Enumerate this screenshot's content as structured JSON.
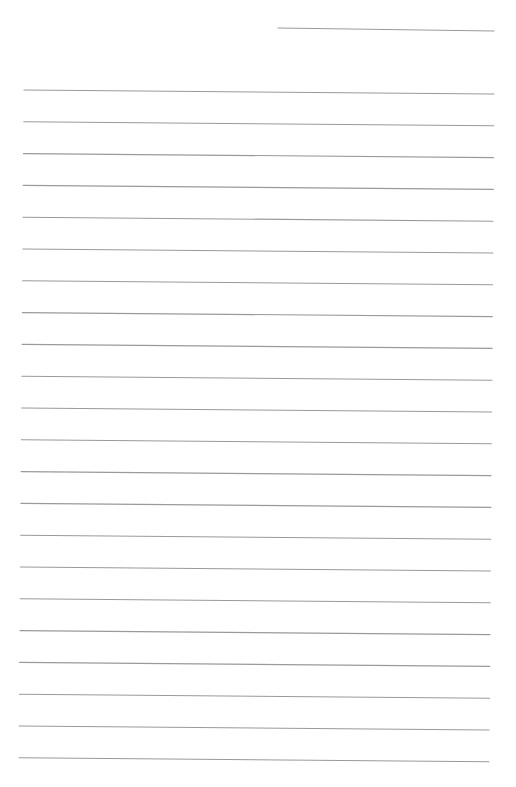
{
  "page": {
    "type": "lined-paper",
    "background_color": "#ffffff",
    "line_color": "#9a9a9a",
    "header_line": {
      "x1": 278,
      "y1": 28,
      "x2": 494,
      "y2": 31,
      "label": ""
    },
    "ruled_lines": {
      "count": 22,
      "first_y": 90,
      "spacing": 31.8,
      "x_start_top": 24,
      "x_start_bottom": 19,
      "x_end_top": 494,
      "x_end_bottom": 489,
      "slope_drop": 4
    },
    "text_content": []
  }
}
